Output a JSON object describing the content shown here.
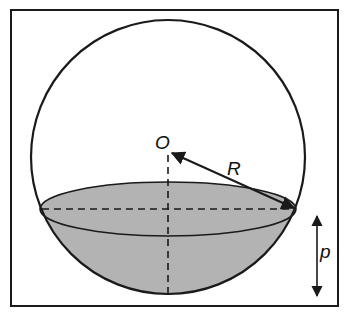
{
  "diagram": {
    "type": "sphere-with-spherical-cap",
    "labels": {
      "center": "O",
      "radius": "R",
      "depth": "p"
    },
    "colors": {
      "stroke": "#1a1a1a",
      "cap_fill": "#b3b3b3",
      "background": "#ffffff"
    }
  }
}
